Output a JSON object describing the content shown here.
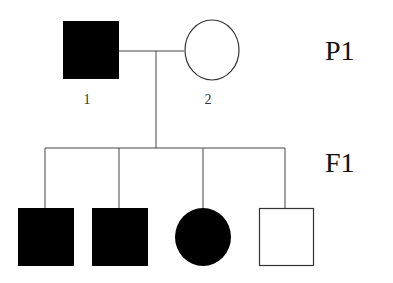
{
  "diagram": {
    "type": "pedigree",
    "generations": [
      {
        "label": "P1"
      },
      {
        "label": "F1"
      }
    ],
    "parents": [
      {
        "id": "1",
        "label": "1",
        "sex": "male",
        "affected": true
      },
      {
        "id": "2",
        "label": "2",
        "sex": "female",
        "affected": false
      }
    ],
    "children": [
      {
        "sex": "male",
        "affected": true
      },
      {
        "sex": "male",
        "affected": true
      },
      {
        "sex": "female",
        "affected": true
      },
      {
        "sex": "male",
        "affected": false
      }
    ],
    "colors": {
      "affected": "#000000",
      "unaffected": "#ffffff",
      "line": "#333333"
    }
  }
}
